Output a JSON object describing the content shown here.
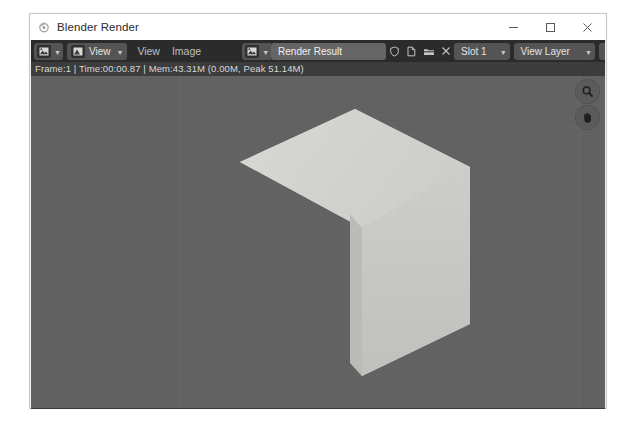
{
  "window": {
    "title": "Blender Render",
    "app_icon": "blender-icon",
    "controls": {
      "minimize": "minimize-icon",
      "maximize": "maximize-icon",
      "close": "close-icon"
    }
  },
  "header": {
    "editor_type_icon": "image-editor-icon",
    "view_mode_icon": "image-view-mode-icon",
    "view_mode_label": "View",
    "menus": [
      "View",
      "Image"
    ],
    "datablock": {
      "type_icon": "image-datablock-icon",
      "name": "Render Result",
      "fake_user_icon": "shield-icon",
      "new_icon": "new-image-icon",
      "open_icon": "open-folder-icon",
      "unlink_icon": "close-icon"
    },
    "slot": {
      "label": "Slot 1"
    },
    "layer": {
      "label": "View Layer"
    },
    "pass": {
      "label": "Combined"
    },
    "display_channels_icon": "display-channels-icon"
  },
  "stats": {
    "text": "Frame:1 | Time:00:00.87 | Mem:43.31M (0.00M, Peak 51.14M)",
    "frame": "Frame:1",
    "time": "Time:00:00.87",
    "mem": "Mem:43.31M (0.00M, Peak 51.14M)"
  },
  "gizmos": {
    "zoom_icon": "magnifier-icon",
    "pan_icon": "hand-icon"
  },
  "canvas": {
    "background_color": "#616161",
    "render_background_color": "#626262",
    "cube": {
      "top_face_color": "#d6d6d3",
      "right_face_color": "#c7c7c3",
      "front_face_color": "#bdbdb9",
      "description": "shaded cube render"
    }
  },
  "colors": {
    "titlebar": "#ffffff",
    "header": "#2b2b2b",
    "button": "#545454",
    "field": "#656565",
    "text_light": "#e4e4e4"
  }
}
